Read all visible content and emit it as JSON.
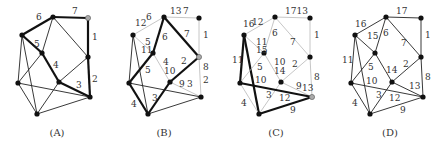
{
  "vertices": {
    "top": [
      53,
      17
    ],
    "tr": [
      88,
      18
    ],
    "lu": [
      22,
      35
    ],
    "mid": [
      42,
      53
    ],
    "rm": [
      88,
      57
    ],
    "cl": [
      59,
      82
    ],
    "ll": [
      18,
      83
    ],
    "rl": [
      90,
      97
    ],
    "bot": [
      37,
      114
    ]
  },
  "edges": [
    [
      "top",
      "tr"
    ],
    [
      "top",
      "lu"
    ],
    [
      "top",
      "mid"
    ],
    [
      "top",
      "rm"
    ],
    [
      "tr",
      "rm"
    ],
    [
      "lu",
      "mid"
    ],
    [
      "lu",
      "ll"
    ],
    [
      "lu",
      "bot"
    ],
    [
      "mid",
      "cl"
    ],
    [
      "mid",
      "ll"
    ],
    [
      "cl",
      "rm"
    ],
    [
      "cl",
      "rl"
    ],
    [
      "cl",
      "bot"
    ],
    [
      "ll",
      "rl"
    ],
    [
      "ll",
      "bot"
    ],
    [
      "rm",
      "rl"
    ],
    [
      "bot",
      "rl"
    ]
  ],
  "panels": [
    {
      "id": "A",
      "caption": "(A)",
      "offset": 0,
      "caption_x": 57,
      "default_edge": "normal",
      "gray_vertex": "tr",
      "bold_edges": [
        [
          "top",
          "tr"
        ],
        [
          "top",
          "lu"
        ],
        [
          "lu",
          "mid"
        ],
        [
          "mid",
          "cl"
        ],
        [
          "cl",
          "rl"
        ],
        [
          "rm",
          "rl"
        ],
        [
          "tr",
          "rm"
        ]
      ],
      "light_edges": [],
      "labels": [
        {
          "t": "7",
          "x": 72,
          "y": 14
        },
        {
          "t": "6",
          "x": 36,
          "y": 20
        },
        {
          "t": "1",
          "x": 92,
          "y": 40
        },
        {
          "t": "5",
          "x": 34,
          "y": 47
        },
        {
          "t": "4",
          "x": 53,
          "y": 68
        },
        {
          "t": "3",
          "x": 76,
          "y": 88
        },
        {
          "t": "2",
          "x": 92,
          "y": 82
        }
      ]
    },
    {
      "id": "B",
      "caption": "(B)",
      "offset": 111,
      "caption_x": 164,
      "default_edge": "normal",
      "gray_vertex": "rm",
      "bold_edges": [
        [
          "top",
          "mid"
        ],
        [
          "top",
          "rm"
        ],
        [
          "mid",
          "ll"
        ],
        [
          "ll",
          "bot"
        ],
        [
          "cl",
          "bot"
        ],
        [
          "cl",
          "rm"
        ]
      ],
      "light_edges": [
        [
          "top",
          "tr"
        ],
        [
          "top",
          "lu"
        ],
        [
          "tr",
          "rm"
        ],
        [
          "lu",
          "mid"
        ],
        [
          "mid",
          "cl"
        ],
        [
          "cl",
          "rl"
        ],
        [
          "rm",
          "rl"
        ]
      ],
      "labels": [
        {
          "t": "13",
          "x": 170,
          "y": 14
        },
        {
          "t": "7",
          "x": 183,
          "y": 14
        },
        {
          "t": "12",
          "x": 135,
          "y": 26
        },
        {
          "t": "6",
          "x": 146,
          "y": 20
        },
        {
          "t": "6",
          "x": 162,
          "y": 40
        },
        {
          "t": "7",
          "x": 184,
          "y": 37
        },
        {
          "t": "1",
          "x": 203,
          "y": 38
        },
        {
          "t": "5",
          "x": 145,
          "y": 45
        },
        {
          "t": "11",
          "x": 141,
          "y": 53
        },
        {
          "t": "4",
          "x": 163,
          "y": 65
        },
        {
          "t": "10",
          "x": 164,
          "y": 74
        },
        {
          "t": "2",
          "x": 181,
          "y": 64
        },
        {
          "t": "8",
          "x": 203,
          "y": 70
        },
        {
          "t": "5",
          "x": 145,
          "y": 73
        },
        {
          "t": "9",
          "x": 179,
          "y": 87
        },
        {
          "t": "3",
          "x": 187,
          "y": 87
        },
        {
          "t": "2",
          "x": 203,
          "y": 83
        },
        {
          "t": "3",
          "x": 152,
          "y": 101
        },
        {
          "t": "4",
          "x": 131,
          "y": 107
        }
      ]
    },
    {
      "id": "C",
      "caption": "(C)",
      "offset": 222,
      "caption_x": 276,
      "default_edge": "light",
      "gray_vertex": "rl",
      "bold_edges": [
        [
          "lu",
          "ll"
        ],
        [
          "lu",
          "bot"
        ],
        [
          "ll",
          "rl"
        ],
        [
          "bot",
          "rl"
        ]
      ],
      "light_edges": [],
      "labels": [
        {
          "t": "1713",
          "x": 285,
          "y": 14
        },
        {
          "t": "16",
          "x": 243,
          "y": 27
        },
        {
          "t": "12",
          "x": 252,
          "y": 25
        },
        {
          "t": "6",
          "x": 272,
          "y": 36
        },
        {
          "t": "7",
          "x": 290,
          "y": 45
        },
        {
          "t": "1",
          "x": 314,
          "y": 38
        },
        {
          "t": "11",
          "x": 256,
          "y": 45
        },
        {
          "t": "15",
          "x": 256,
          "y": 53
        },
        {
          "t": "11",
          "x": 232,
          "y": 63
        },
        {
          "t": "5",
          "x": 257,
          "y": 70
        },
        {
          "t": "10",
          "x": 274,
          "y": 65
        },
        {
          "t": "14",
          "x": 274,
          "y": 74
        },
        {
          "t": "2",
          "x": 292,
          "y": 67
        },
        {
          "t": "8",
          "x": 314,
          "y": 80
        },
        {
          "t": "10",
          "x": 255,
          "y": 83
        },
        {
          "t": "9",
          "x": 296,
          "y": 89
        },
        {
          "t": "13",
          "x": 302,
          "y": 91
        },
        {
          "t": "3",
          "x": 266,
          "y": 98
        },
        {
          "t": "12",
          "x": 279,
          "y": 101
        },
        {
          "t": "4",
          "x": 241,
          "y": 106
        },
        {
          "t": "9",
          "x": 290,
          "y": 113
        }
      ]
    },
    {
      "id": "D",
      "caption": "(D)",
      "offset": 333,
      "caption_x": 390,
      "default_edge": "normal",
      "gray_vertex": null,
      "bold_edges": [],
      "light_edges": [],
      "labels": [
        {
          "t": "17",
          "x": 396,
          "y": 14
        },
        {
          "t": "16",
          "x": 355,
          "y": 27
        },
        {
          "t": "6",
          "x": 383,
          "y": 36
        },
        {
          "t": "1",
          "x": 425,
          "y": 38
        },
        {
          "t": "15",
          "x": 367,
          "y": 39
        },
        {
          "t": "7",
          "x": 401,
          "y": 46
        },
        {
          "t": "11",
          "x": 342,
          "y": 63
        },
        {
          "t": "5",
          "x": 368,
          "y": 70
        },
        {
          "t": "2",
          "x": 403,
          "y": 67
        },
        {
          "t": "14",
          "x": 386,
          "y": 73
        },
        {
          "t": "8",
          "x": 425,
          "y": 80
        },
        {
          "t": "10",
          "x": 366,
          "y": 84
        },
        {
          "t": "13",
          "x": 409,
          "y": 89
        },
        {
          "t": "3",
          "x": 376,
          "y": 98
        },
        {
          "t": "12",
          "x": 389,
          "y": 101
        },
        {
          "t": "4",
          "x": 352,
          "y": 106
        },
        {
          "t": "9",
          "x": 400,
          "y": 113
        }
      ]
    }
  ],
  "captions": {
    "a": "(A)",
    "b": "(B)",
    "c": "(C)",
    "d": "(D)"
  }
}
